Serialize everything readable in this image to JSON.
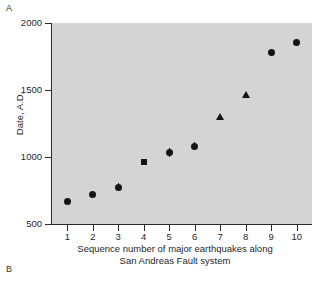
{
  "figure": {
    "panel_label_top": "A",
    "panel_label_bottom": "B",
    "background_color": "#ffffff",
    "plot_background_color": "#d4d4d4",
    "marker_color": "#141414",
    "axis_color": "#2b2b2b"
  },
  "chart_data": {
    "type": "scatter",
    "title": "",
    "xlabel_line1": "Sequence number of major earthquakes along",
    "xlabel_line2": "San Andreas Fault system",
    "ylabel": "Date, A.D.",
    "xlim": [
      0.4,
      10.6
    ],
    "ylim": [
      500,
      2000
    ],
    "xticks": [
      1,
      2,
      3,
      4,
      5,
      6,
      7,
      8,
      9,
      10
    ],
    "xtick_labels": [
      "1",
      "2",
      "3",
      "4",
      "5",
      "6",
      "7",
      "8",
      "9",
      "10"
    ],
    "yticks": [
      500,
      1000,
      1500,
      2000
    ],
    "ytick_labels": [
      "500",
      "1000",
      "1500",
      "2000"
    ],
    "grid": false,
    "legend": false,
    "x": [
      1,
      2,
      3,
      4,
      5,
      6,
      7,
      8,
      9,
      10
    ],
    "values": [
      665,
      720,
      775,
      965,
      1035,
      1080,
      1300,
      1470,
      1780,
      1855
    ],
    "markers": [
      "circle",
      "circle",
      "circle",
      "square",
      "circle",
      "circle",
      "triangle",
      "triangle",
      "circle",
      "circle"
    ],
    "yerr": [
      0,
      0,
      30,
      0,
      35,
      30,
      0,
      0,
      25,
      25
    ],
    "points": [
      {
        "seq": 1,
        "date": 665,
        "marker": "circle",
        "error": 0
      },
      {
        "seq": 2,
        "date": 720,
        "marker": "circle",
        "error": 0
      },
      {
        "seq": 3,
        "date": 775,
        "marker": "circle",
        "error": 30
      },
      {
        "seq": 4,
        "date": 965,
        "marker": "square",
        "error": 0
      },
      {
        "seq": 5,
        "date": 1035,
        "marker": "circle",
        "error": 35
      },
      {
        "seq": 6,
        "date": 1080,
        "marker": "circle",
        "error": 30
      },
      {
        "seq": 7,
        "date": 1300,
        "marker": "triangle",
        "error": 0
      },
      {
        "seq": 8,
        "date": 1470,
        "marker": "triangle",
        "error": 0
      },
      {
        "seq": 9,
        "date": 1780,
        "marker": "circle",
        "error": 25
      },
      {
        "seq": 10,
        "date": 1855,
        "marker": "circle",
        "error": 25
      }
    ]
  }
}
